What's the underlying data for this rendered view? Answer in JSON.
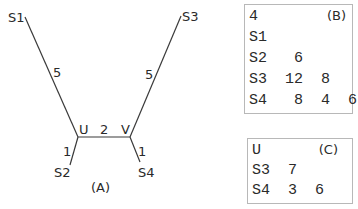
{
  "tree_a": {
    "caption": "(A)",
    "nodes": {
      "S1": "S1",
      "S2": "S2",
      "S3": "S3",
      "S4": "S4",
      "U": "U",
      "V": "V"
    },
    "edges": [
      {
        "from": "S1",
        "to": "U",
        "weight": "5"
      },
      {
        "from": "S2",
        "to": "U",
        "weight": "1"
      },
      {
        "from": "U",
        "to": "V",
        "weight": "2"
      },
      {
        "from": "S3",
        "to": "V",
        "weight": "5"
      },
      {
        "from": "S4",
        "to": "V",
        "weight": "1"
      }
    ]
  },
  "matrix_b": {
    "caption": "(B)",
    "rows": [
      "4",
      "S1",
      "S2   6",
      "S3  12  8",
      "S4   8  4  6"
    ]
  },
  "matrix_c": {
    "caption": "(C)",
    "rows": [
      "U",
      "S3  7",
      "S4  3  6"
    ]
  }
}
